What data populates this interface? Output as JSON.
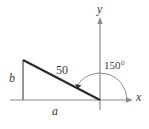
{
  "figure": {
    "type": "geometry-diagram",
    "colors": {
      "axis": "#8c8c8c",
      "triangle_leg": "#7a7a7a",
      "hypotenuse": "#2b2b2b",
      "arc": "#8c8c8c",
      "text": "#3a3a3a",
      "background": "#ffffff"
    },
    "labels": {
      "vertical_leg": "b",
      "horizontal_leg": "a",
      "hypotenuse": "50",
      "angle": "150°",
      "x_axis": "x",
      "y_axis": "y"
    },
    "geometry": {
      "origin": [
        100,
        100
      ],
      "vertex_top_left": [
        23,
        60
      ],
      "vertex_bottom_left": [
        23,
        100
      ],
      "x_axis_from": [
        10,
        100
      ],
      "x_axis_to": [
        133,
        100
      ],
      "y_axis_from": [
        100,
        20
      ],
      "y_axis_to": [
        100,
        110
      ],
      "angle_degrees": 150,
      "hypotenuse_length": 50,
      "arc_radius": 27
    }
  }
}
